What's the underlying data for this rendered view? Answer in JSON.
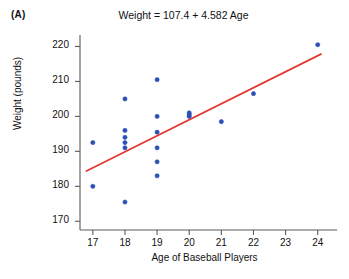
{
  "panel": {
    "label": "(A)"
  },
  "chart_data": {
    "type": "scatter",
    "title": "Weight = 107.4 + 4.582 Age",
    "xlabel": "Age of Baseball Players",
    "ylabel": "Weight (pounds)",
    "xlim": [
      16.6,
      24.6
    ],
    "ylim": [
      167.5,
      223
    ],
    "xticks": [
      17,
      18,
      19,
      20,
      21,
      22,
      23,
      24
    ],
    "yticks": [
      170,
      180,
      190,
      200,
      210,
      220
    ],
    "grid": false,
    "legend": null,
    "point_color": "#2a4fb5",
    "line_color": "#e03a31",
    "series": [
      {
        "name": "Baseball players",
        "x": [
          17,
          17,
          18,
          18,
          18,
          18,
          18,
          18,
          19,
          19,
          19,
          19,
          19,
          19,
          20,
          20,
          20,
          21,
          22,
          24
        ],
        "y": [
          180,
          192.5,
          205,
          196,
          192.5,
          194,
          191,
          175.5,
          210.5,
          200,
          195.5,
          191,
          187,
          183,
          201,
          200,
          200.5,
          198.5,
          206.5,
          220.5
        ]
      }
    ],
    "fit_line": {
      "equation": "Weight = 107.4 + 4.582 Age",
      "intercept": 107.4,
      "slope": 4.582,
      "x_start": 16.8,
      "x_end": 24.1
    }
  }
}
